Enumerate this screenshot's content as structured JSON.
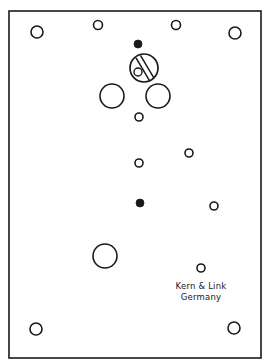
{
  "diagram": {
    "stroke_color": "#1a1a1a",
    "background": "#ffffff",
    "plate": {
      "x1": 9,
      "y1": 11,
      "x2": 261,
      "y2": 358
    },
    "holes": [
      {
        "name": "corner-top-left",
        "cx": 37,
        "cy": 32,
        "r": 6,
        "filled": false
      },
      {
        "name": "corner-top-right",
        "cx": 235,
        "cy": 33,
        "r": 6,
        "filled": false
      },
      {
        "name": "top-small-left",
        "cx": 98,
        "cy": 25,
        "r": 4.5,
        "filled": false
      },
      {
        "name": "top-small-right",
        "cx": 176,
        "cy": 25,
        "r": 4.5,
        "filled": false
      },
      {
        "name": "upper-dot",
        "cx": 138,
        "cy": 44,
        "r": 4,
        "filled": true
      },
      {
        "name": "large-left",
        "cx": 112,
        "cy": 96,
        "r": 12,
        "filled": false
      },
      {
        "name": "large-right",
        "cx": 158,
        "cy": 96,
        "r": 12,
        "filled": false
      },
      {
        "name": "center-small-1",
        "cx": 139,
        "cy": 117,
        "r": 4,
        "filled": false
      },
      {
        "name": "center-small-2",
        "cx": 139,
        "cy": 163,
        "r": 4,
        "filled": false
      },
      {
        "name": "right-small-1",
        "cx": 189,
        "cy": 153,
        "r": 4,
        "filled": false
      },
      {
        "name": "center-dot",
        "cx": 140,
        "cy": 203,
        "r": 4,
        "filled": true
      },
      {
        "name": "right-small-2",
        "cx": 214,
        "cy": 206,
        "r": 4,
        "filled": false
      },
      {
        "name": "large-lower",
        "cx": 105,
        "cy": 256,
        "r": 12,
        "filled": false
      },
      {
        "name": "label-small",
        "cx": 201,
        "cy": 268,
        "r": 4,
        "filled": false
      },
      {
        "name": "corner-bottom-left",
        "cx": 36,
        "cy": 329,
        "r": 6,
        "filled": false
      },
      {
        "name": "corner-bottom-right",
        "cx": 234,
        "cy": 328,
        "r": 6,
        "filled": false
      }
    ],
    "adjuster": {
      "cx": 144,
      "cy": 68,
      "r": 14,
      "inner_cx": 138,
      "inner_cy": 72,
      "inner_r": 4
    },
    "manufacturer": {
      "line1": "Kern & Link",
      "line2": "Germany"
    }
  }
}
